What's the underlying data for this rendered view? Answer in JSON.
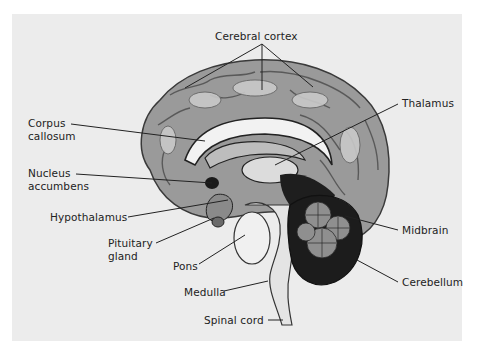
{
  "figure": {
    "background_color": "#ececec"
  },
  "labels": {
    "cerebral_cortex": {
      "lines": [
        "Cerebral cortex"
      ]
    },
    "corpus_callosum": {
      "lines": [
        "Corpus",
        "callosum"
      ]
    },
    "thalamus": {
      "lines": [
        "Thalamus"
      ]
    },
    "nucleus_accumbens": {
      "lines": [
        "Nucleus",
        "accumbens"
      ]
    },
    "hypothalamus": {
      "lines": [
        "Hypothalamus"
      ]
    },
    "pituitary_gland": {
      "lines": [
        "Pituitary",
        "gland"
      ]
    },
    "pons": {
      "lines": [
        "Pons"
      ]
    },
    "medulla": {
      "lines": [
        "Medulla"
      ]
    },
    "spinal_cord": {
      "lines": [
        "Spinal cord"
      ]
    },
    "midbrain": {
      "lines": [
        "Midbrain"
      ]
    },
    "cerebellum": {
      "lines": [
        "Cerebellum"
      ]
    }
  }
}
